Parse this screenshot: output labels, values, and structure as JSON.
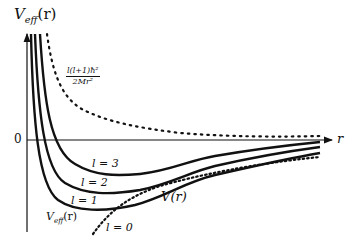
{
  "diagram": {
    "type": "effective-potential-plot",
    "y_axis_label_main": "V",
    "y_axis_label_sub": "eff",
    "y_axis_label_arg": "(r)",
    "x_axis_label": "r",
    "origin_label": "0",
    "centrifugal_label_numerator": "l(l+1)ħ²",
    "centrifugal_label_denominator": "2Mr²",
    "potential_label": "V(r)",
    "veff_curve_label_main": "V",
    "veff_curve_label_sub": "eff",
    "veff_curve_label_arg": "(r)",
    "curve_labels": [
      {
        "id": "l3",
        "text": "l = 3"
      },
      {
        "id": "l2",
        "text": "l = 2"
      },
      {
        "id": "l1",
        "text": "l = 1"
      },
      {
        "id": "l0",
        "text": "l = 0"
      }
    ],
    "colors": {
      "line": "#111111",
      "background": "#ffffff"
    }
  }
}
